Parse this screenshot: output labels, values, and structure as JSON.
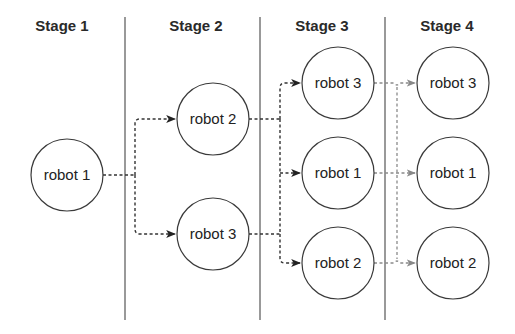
{
  "diagram": {
    "stages": [
      {
        "label": "Stage 1",
        "nodes": [
          {
            "label": "robot 1"
          }
        ]
      },
      {
        "label": "Stage 2",
        "nodes": [
          {
            "label": "robot 2"
          },
          {
            "label": "robot 3"
          }
        ]
      },
      {
        "label": "Stage 3",
        "nodes": [
          {
            "label": "robot 3"
          },
          {
            "label": "robot 1"
          },
          {
            "label": "robot 2"
          }
        ]
      },
      {
        "label": "Stage 4",
        "nodes": [
          {
            "label": "robot 3"
          },
          {
            "label": "robot 1"
          },
          {
            "label": "robot 2"
          }
        ]
      }
    ],
    "edges": [
      {
        "from": "Stage 1 / robot 1",
        "to": "Stage 2 / robot 2",
        "style": "dashed-dark"
      },
      {
        "from": "Stage 1 / robot 1",
        "to": "Stage 2 / robot 3",
        "style": "dashed-dark"
      },
      {
        "from": "Stage 2 / robot 2",
        "to": "Stage 3 / robot 3",
        "style": "dashed-dark"
      },
      {
        "from": "Stage 2 / robot 2",
        "to": "Stage 3 / robot 1",
        "style": "dashed-dark"
      },
      {
        "from": "Stage 2 / robot 2",
        "to": "Stage 3 / robot 2",
        "style": "dashed-dark"
      },
      {
        "from": "Stage 2 / robot 3",
        "to": "Stage 3 / robot 3",
        "style": "dashed-dark"
      },
      {
        "from": "Stage 2 / robot 3",
        "to": "Stage 3 / robot 1",
        "style": "dashed-dark"
      },
      {
        "from": "Stage 2 / robot 3",
        "to": "Stage 3 / robot 2",
        "style": "dashed-dark"
      },
      {
        "from": "Stage 3 / robot 3",
        "to": "Stage 4 / robot 3",
        "style": "dashed-gray"
      },
      {
        "from": "Stage 3 / robot 1",
        "to": "Stage 4 / robot 1",
        "style": "dashed-gray"
      },
      {
        "from": "Stage 3 / robot 2",
        "to": "Stage 4 / robot 2",
        "style": "dashed-gray"
      }
    ],
    "colors": {
      "dark_edge": "#333333",
      "gray_edge": "#8a8a8a",
      "node_stroke": "#3a3a3a",
      "divider": "#555555"
    }
  }
}
